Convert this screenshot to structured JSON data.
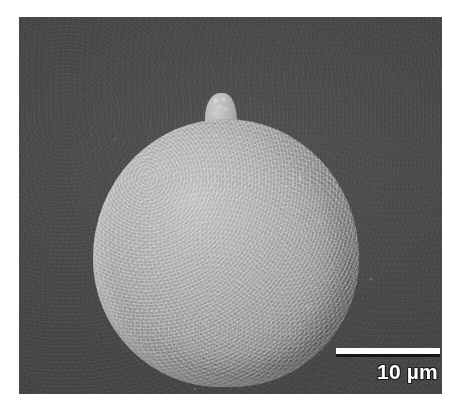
{
  "figure": {
    "type": "sem-micrograph",
    "caption_text": "",
    "background_color": "#4b4b4b",
    "canvas_color": "#ffffff"
  },
  "micrograph": {
    "name": "sem-micrograph-spherical-spore",
    "frame": {
      "x": 19,
      "y": 17,
      "width": 423,
      "height": 377
    },
    "background_tone": "#4b4b4b",
    "specimen": {
      "name": "spherical-particle",
      "description": "spherical spore with granular warty surface",
      "surface_color_light": "#c8c8c8",
      "surface_color_mid": "#a6a6a6",
      "surface_color_dark": "#7e7e7e",
      "appendage": {
        "name": "germ-tube-protrusion",
        "position": "top"
      }
    }
  },
  "scalebar": {
    "name": "scale-bar",
    "label": "10 µm",
    "value": 10,
    "unit": "µm",
    "bar_color": "#ffffff",
    "bar_core_color": "#151515",
    "text_color": "#ffffff",
    "length_px": 104,
    "position": "bottom-right"
  }
}
